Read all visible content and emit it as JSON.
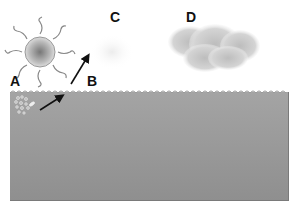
{
  "diagram": {
    "labels": {
      "a": "A",
      "b": "B",
      "c": "C",
      "d": "D"
    },
    "elements": {
      "sun": "sun-icon",
      "particles": "particle-cluster-icon",
      "arrow_underwater": "arrow-icon",
      "arrow_air": "arrow-icon",
      "faint_cloud": "faint-cloud-icon",
      "cloud": "cloud-icon",
      "water": "water-body"
    },
    "colors": {
      "water": "#9a9a9a",
      "cloud": "#c8c8c8",
      "sun": "#888888"
    }
  }
}
